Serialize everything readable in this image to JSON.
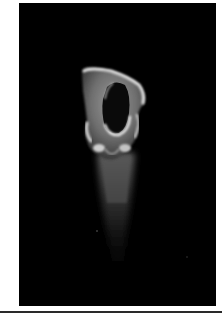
{
  "image": {
    "subject": "specimen-micrograph",
    "description": "Grayscale micrograph of a hollow, cup-shaped specimen on a black background",
    "background_color": "#000000",
    "page_color": "#ffffff",
    "specimen_highlight_color": "#d8d8d8"
  }
}
